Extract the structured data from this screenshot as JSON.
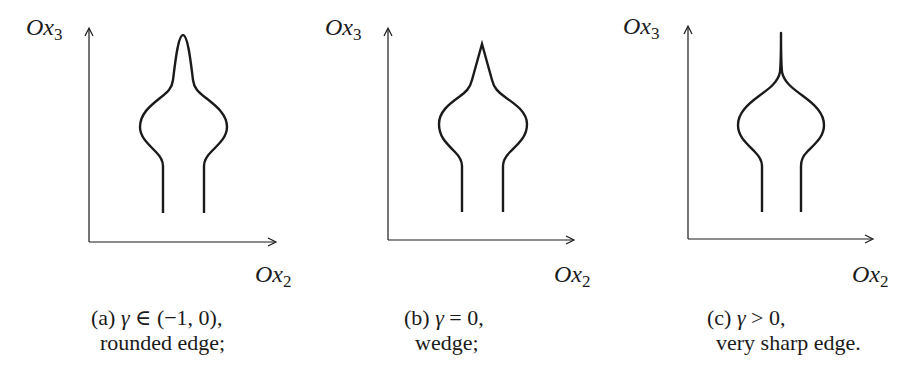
{
  "figure": {
    "panels": [
      {
        "id": "a",
        "y_axis_label": {
          "base": "Ox",
          "sub": "3"
        },
        "x_axis_label": {
          "base": "Ox",
          "sub": "2"
        },
        "caption_line1_prefix": "(a) ",
        "caption_gamma": "γ",
        "caption_line1_suffix": " ∈ (−1, 0),",
        "caption_line2": "rounded edge;",
        "tip_type": "rounded"
      },
      {
        "id": "b",
        "y_axis_label": {
          "base": "Ox",
          "sub": "3"
        },
        "x_axis_label": {
          "base": "Ox",
          "sub": "2"
        },
        "caption_line1_prefix": "(b) ",
        "caption_gamma": "γ",
        "caption_line1_suffix": " = 0,",
        "caption_line2": "wedge;",
        "tip_type": "wedge"
      },
      {
        "id": "c",
        "y_axis_label": {
          "base": "Ox",
          "sub": "3"
        },
        "x_axis_label": {
          "base": "Ox",
          "sub": "2"
        },
        "caption_line1_prefix": "(c) ",
        "caption_gamma": "γ",
        "caption_line1_suffix": " > 0,",
        "caption_line2": "very sharp edge.",
        "tip_type": "cusp"
      }
    ],
    "colors": {
      "stroke": "#1a1a1a",
      "background": "#ffffff"
    }
  }
}
